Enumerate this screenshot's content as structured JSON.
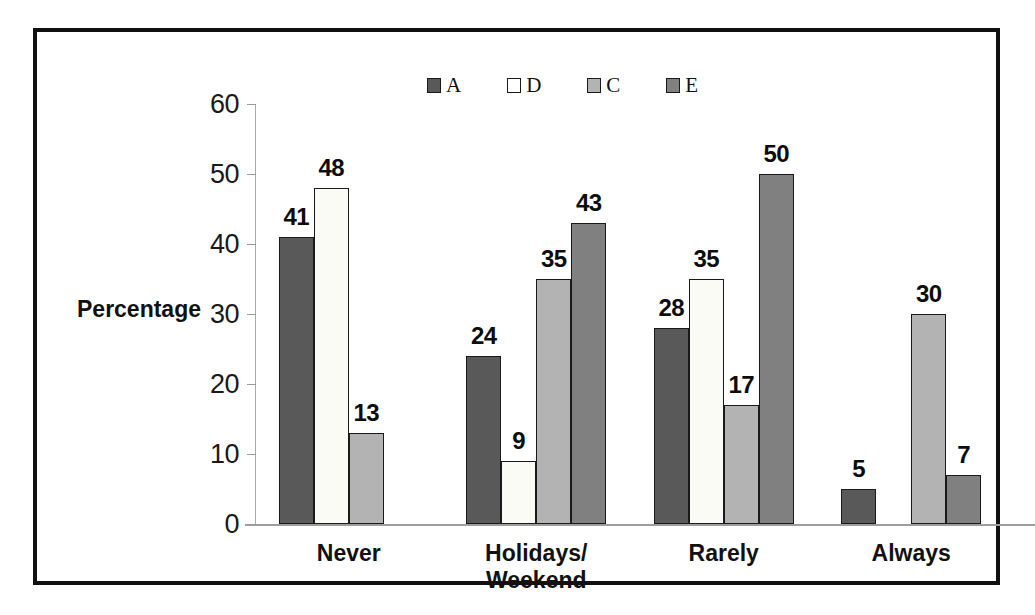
{
  "chart_data": {
    "type": "bar",
    "title": "",
    "subtitle": "",
    "xlabel": "",
    "ylabel": "Percentage",
    "ylim": [
      0,
      60
    ],
    "yticks": [
      0,
      10,
      20,
      30,
      40,
      50,
      60
    ],
    "grid": false,
    "legend_position": "top-center",
    "categories": [
      "Never",
      "Holidays/\nWeekend",
      "Rarely",
      "Always"
    ],
    "series": [
      {
        "name": "A",
        "color": "#595959",
        "values": [
          41,
          24,
          28,
          5
        ]
      },
      {
        "name": "D",
        "color": "#fbfbf5",
        "values": [
          48,
          9,
          35,
          null
        ]
      },
      {
        "name": "C",
        "color": "#b3b3b3",
        "values": [
          13,
          35,
          17,
          30
        ]
      },
      {
        "name": "E",
        "color": "#808080",
        "values": [
          null,
          43,
          50,
          7
        ]
      }
    ],
    "data_labels": [
      [
        "41",
        "48",
        "13",
        ""
      ],
      [
        "24",
        "9",
        "35",
        "43"
      ],
      [
        "28",
        "35",
        "17",
        "50"
      ],
      [
        "5",
        "",
        "30",
        "7"
      ]
    ]
  },
  "legend": {
    "items": [
      {
        "label": "A",
        "color": "#595959"
      },
      {
        "label": "D",
        "color": "#ffffff"
      },
      {
        "label": "C",
        "color": "#b3b3b3"
      },
      {
        "label": "E",
        "color": "#808080"
      }
    ]
  },
  "axis": {
    "y_title": "Percentage",
    "y_tick_labels": [
      "60",
      "50",
      "40",
      "30",
      "20",
      "10",
      "0"
    ],
    "x_tick_labels": [
      {
        "line1": "Never",
        "line2": ""
      },
      {
        "line1": "Holidays/",
        "line2": "Weekend"
      },
      {
        "line1": "Rarely",
        "line2": ""
      },
      {
        "line1": "Always",
        "line2": ""
      }
    ]
  },
  "style": {
    "frame_color": "#111111",
    "axis_color": "#9e9e9e",
    "bar_outline": "#1a1a1a",
    "background": "#ffffff"
  }
}
